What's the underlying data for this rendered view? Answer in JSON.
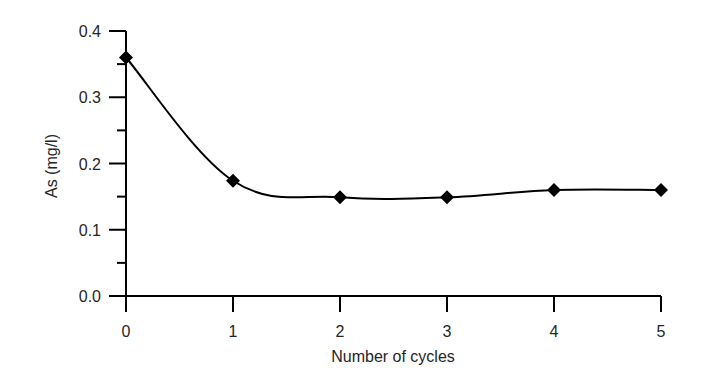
{
  "chart_data": {
    "type": "line",
    "title": "",
    "xlabel": "Number of cycles",
    "ylabel": "As (mg/l)",
    "x": [
      0,
      1,
      2,
      3,
      4,
      5
    ],
    "series": [
      {
        "name": "As",
        "values": [
          0.36,
          0.174,
          0.149,
          0.149,
          0.16,
          0.16
        ],
        "marker": "diamond",
        "line": "smooth",
        "color": "#000000"
      }
    ],
    "xlim": [
      0,
      5
    ],
    "ylim": [
      0.0,
      0.4
    ],
    "xticks": [
      "0",
      "1",
      "2",
      "3",
      "4",
      "5"
    ],
    "yticks": [
      "0.0",
      "0.1",
      "0.2",
      "0.3",
      "0.4"
    ],
    "y_minor_step": 0.05,
    "grid": false,
    "legend": null
  },
  "colors": {
    "axis": "#000000",
    "text": "#262626",
    "background": "#ffffff"
  }
}
